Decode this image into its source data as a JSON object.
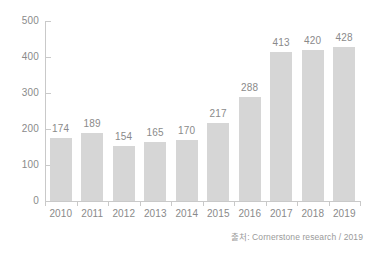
{
  "chart_data": {
    "type": "bar",
    "title": "",
    "subtitle": "",
    "xlabel": "",
    "ylabel": "",
    "categories": [
      "2010",
      "2011",
      "2012",
      "2013",
      "2014",
      "2015",
      "2016",
      "2017",
      "2018",
      "2019"
    ],
    "values": [
      174,
      189,
      154,
      165,
      170,
      217,
      288,
      413,
      420,
      428
    ],
    "value_labels": [
      "174",
      "189",
      "154",
      "165",
      "170",
      "217",
      "288",
      "413",
      "420",
      "428"
    ],
    "ylim": [
      0,
      500
    ],
    "y_ticks": [
      0,
      100,
      200,
      300,
      400,
      500
    ],
    "y_tick_labels": [
      "0",
      "100",
      "200",
      "300",
      "400",
      "500"
    ],
    "grid": false,
    "legend": null,
    "bar_color": "#d6d6d6",
    "axis_color": "#c9c9c9",
    "text_color": "#8a8a8a"
  },
  "footer": {
    "source": "출처: Cornerstone research / 2019"
  }
}
